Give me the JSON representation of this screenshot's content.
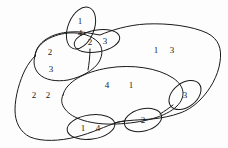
{
  "figure": {
    "type": "set-diagram",
    "background_color": "#fdfdfd",
    "stroke_color": "#1a1a1a",
    "text_color": "#1a1a1a",
    "width": 228,
    "height": 148
  },
  "labels": [
    {
      "name": "label-top-small-upper",
      "text": "1",
      "x": 80,
      "y": 21
    },
    {
      "name": "label-top-small-lower",
      "text": "4",
      "x": 80,
      "y": 33
    },
    {
      "name": "label-top-right-ellipse-left",
      "text": "2",
      "x": 90,
      "y": 42
    },
    {
      "name": "label-top-right-ellipse-right",
      "text": "3",
      "x": 105,
      "y": 41
    },
    {
      "name": "label-left-upper",
      "text": "2",
      "x": 50,
      "y": 52
    },
    {
      "name": "label-left-lower",
      "text": "3",
      "x": 51,
      "y": 69
    },
    {
      "name": "label-right-upper-a",
      "text": "1",
      "x": 156,
      "y": 50
    },
    {
      "name": "label-right-upper-b",
      "text": "3",
      "x": 172,
      "y": 50
    },
    {
      "name": "label-center-a",
      "text": "4",
      "x": 107,
      "y": 85
    },
    {
      "name": "label-center-b",
      "text": "1",
      "x": 131,
      "y": 85
    },
    {
      "name": "label-left-outer-a",
      "text": "2",
      "x": 34,
      "y": 95
    },
    {
      "name": "label-left-outer-b",
      "text": "2",
      "x": 48,
      "y": 95
    },
    {
      "name": "label-right-ellipse",
      "text": "3",
      "x": 185,
      "y": 95
    },
    {
      "name": "label-bottom-left-ellipse-a",
      "text": "1",
      "x": 83,
      "y": 128
    },
    {
      "name": "label-bottom-left-ellipse-b",
      "text": "4",
      "x": 98,
      "y": 128
    },
    {
      "name": "label-bottom-center-ellipse",
      "text": "2",
      "x": 143,
      "y": 120
    }
  ],
  "shapes": [
    {
      "name": "outer-boundary-curve"
    },
    {
      "name": "upper-left-lobe-curve"
    },
    {
      "name": "central-large-ellipse"
    },
    {
      "name": "top-small-ellipse"
    },
    {
      "name": "top-right-small-ellipse"
    },
    {
      "name": "right-small-ellipse"
    },
    {
      "name": "bottom-left-small-ellipse"
    },
    {
      "name": "bottom-center-small-ellipse"
    },
    {
      "name": "connector-top-stem"
    },
    {
      "name": "connector-bottom-link"
    },
    {
      "name": "connector-right-link"
    }
  ]
}
